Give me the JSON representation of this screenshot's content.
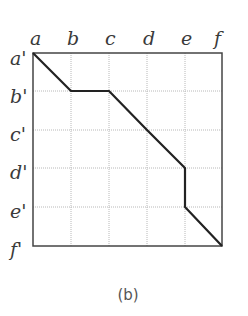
{
  "diagram": {
    "caption": "(b)",
    "columns": [
      "a",
      "b",
      "c",
      "d",
      "e",
      "f"
    ],
    "rows": [
      "a'",
      "b'",
      "c'",
      "d'",
      "e'",
      "f'"
    ],
    "grid": {
      "x0": 33,
      "y0": 53,
      "x1": 222,
      "y1": 246
    },
    "path": [
      [
        "a",
        "a'"
      ],
      [
        "b",
        "b'"
      ],
      [
        "c",
        "b'"
      ],
      [
        "d",
        "c'"
      ],
      [
        "e",
        "d'"
      ],
      [
        "e",
        "e'"
      ],
      [
        "f",
        "f'"
      ]
    ],
    "colors": {
      "path": "#222222",
      "grid": "#b5b5b5",
      "border": "#444444"
    }
  }
}
